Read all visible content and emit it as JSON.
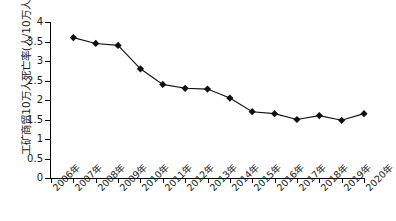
{
  "chart_data": {
    "type": "line",
    "title": "",
    "xlabel": "",
    "ylabel": "工矿商贸10万人死亡率(人/10万人)",
    "categories": [
      "2006年",
      "2007年",
      "2008年",
      "2009年",
      "2010年",
      "2011年",
      "2012年",
      "2013年",
      "2014年",
      "2015年",
      "2016年",
      "2017年",
      "2018年",
      "2019年",
      "2020年"
    ],
    "values": [
      null,
      3.6,
      3.45,
      3.4,
      2.8,
      2.4,
      2.3,
      2.28,
      2.05,
      1.7,
      1.65,
      1.5,
      1.6,
      1.48,
      1.65
    ],
    "series": [
      {
        "name": "工矿商贸10万人死亡率",
        "values": [
          null,
          3.6,
          3.45,
          3.4,
          2.8,
          2.4,
          2.3,
          2.28,
          2.05,
          1.7,
          1.65,
          1.5,
          1.6,
          1.48,
          1.65
        ]
      }
    ],
    "ylim": [
      0,
      4
    ],
    "yticks": [
      0,
      0.5,
      1,
      1.5,
      2,
      2.5,
      3,
      3.5,
      4
    ],
    "ytick_labels": [
      "0",
      "0.5",
      "1",
      "1.5",
      "2",
      "2.5",
      "3",
      "3.5",
      "4"
    ],
    "grid": false,
    "legend": null,
    "marker": "diamond",
    "line_color": "#111111",
    "marker_color": "#111111",
    "axis_color": "#000000",
    "background": "#ffffff"
  }
}
